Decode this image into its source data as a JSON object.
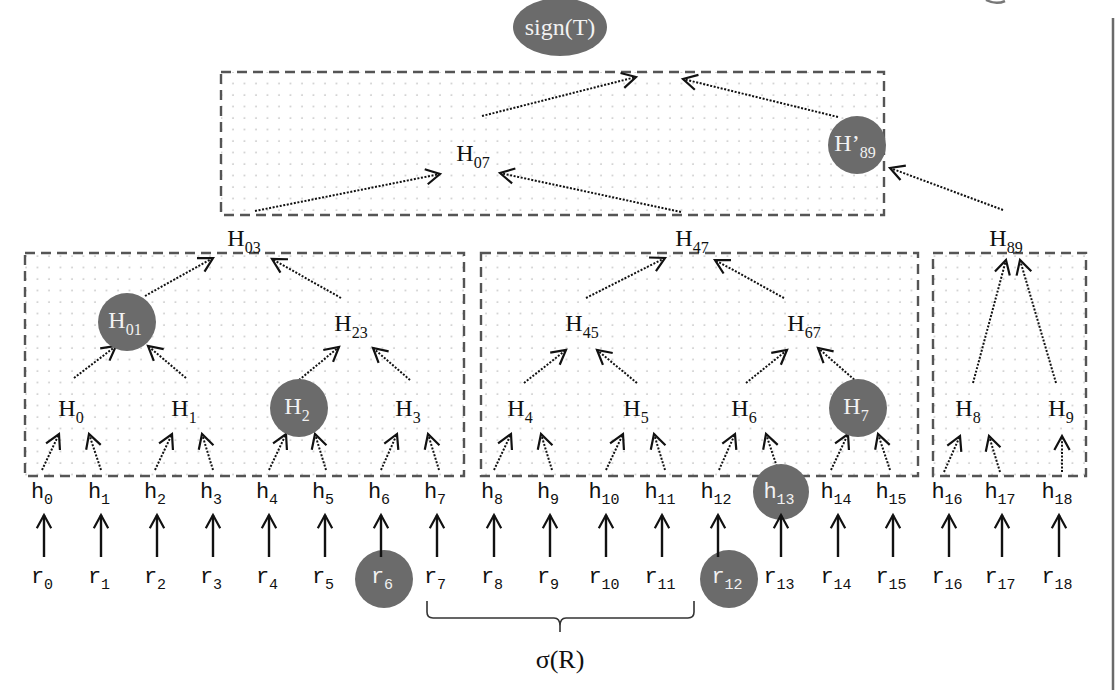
{
  "diagram": {
    "colors": {
      "highlight_fill": "#6b6b6b",
      "highlight_text": "#f2f2f2",
      "text": "#111111",
      "box_border": "#555555",
      "dot": "#c8c8c8",
      "arrow": "#111111"
    },
    "root": {
      "id": "signT",
      "label": "sign(T)",
      "x": 560,
      "y": 27,
      "highlight": true,
      "shape": "ellipse"
    },
    "boxes": [
      {
        "id": "box-top",
        "x": 221,
        "y": 72,
        "w": 663,
        "h": 143
      },
      {
        "id": "box-left",
        "x": 25,
        "y": 253,
        "w": 439,
        "h": 223
      },
      {
        "id": "box-mid",
        "x": 481,
        "y": 253,
        "w": 437,
        "h": 223
      },
      {
        "id": "box-right",
        "x": 933,
        "y": 253,
        "w": 153,
        "h": 223
      }
    ],
    "nodes": [
      {
        "id": "H07",
        "base": "H",
        "sub": "07",
        "x": 475,
        "y": 155,
        "highlight": false
      },
      {
        "id": "H89p",
        "base": "H’",
        "sub": "89",
        "x": 857,
        "y": 145,
        "highlight": true
      },
      {
        "id": "H03",
        "base": "H",
        "sub": "03",
        "x": 246,
        "y": 240,
        "highlight": false
      },
      {
        "id": "H47",
        "base": "H",
        "sub": "47",
        "x": 694,
        "y": 240,
        "highlight": false
      },
      {
        "id": "H89",
        "base": "H",
        "sub": "89",
        "x": 1008,
        "y": 240,
        "highlight": false
      },
      {
        "id": "H01",
        "base": "H",
        "sub": "01",
        "x": 127,
        "y": 322,
        "highlight": true
      },
      {
        "id": "H23",
        "base": "H",
        "sub": "23",
        "x": 353,
        "y": 325,
        "highlight": false
      },
      {
        "id": "H45",
        "base": "H",
        "sub": "45",
        "x": 584,
        "y": 325,
        "highlight": false
      },
      {
        "id": "H67",
        "base": "H",
        "sub": "67",
        "x": 806,
        "y": 325,
        "highlight": false
      },
      {
        "id": "H0",
        "base": "H",
        "sub": "0",
        "x": 73,
        "y": 410,
        "highlight": false
      },
      {
        "id": "H1",
        "base": "H",
        "sub": "1",
        "x": 186,
        "y": 410,
        "highlight": false
      },
      {
        "id": "H2",
        "base": "H",
        "sub": "2",
        "x": 299,
        "y": 408,
        "highlight": true
      },
      {
        "id": "H3",
        "base": "H",
        "sub": "3",
        "x": 410,
        "y": 410,
        "highlight": false
      },
      {
        "id": "H4",
        "base": "H",
        "sub": "4",
        "x": 522,
        "y": 410,
        "highlight": false
      },
      {
        "id": "H5",
        "base": "H",
        "sub": "5",
        "x": 638,
        "y": 410,
        "highlight": false
      },
      {
        "id": "H6",
        "base": "H",
        "sub": "6",
        "x": 746,
        "y": 410,
        "highlight": false
      },
      {
        "id": "H7",
        "base": "H",
        "sub": "7",
        "x": 858,
        "y": 408,
        "highlight": true
      },
      {
        "id": "H8",
        "base": "H",
        "sub": "8",
        "x": 970,
        "y": 410,
        "highlight": false
      },
      {
        "id": "H9",
        "base": "H",
        "sub": "9",
        "x": 1063,
        "y": 410,
        "highlight": false
      }
    ],
    "tree_edges": [
      {
        "from": [
          451,
          156
        ],
        "to": [
          440,
          174
        ],
        "x1": 425,
        "y1": 198,
        "x2": 441,
        "y2": 173,
        "comment": ""
      }
    ],
    "dotted_arrows": [
      {
        "x1": 482,
        "y1": 116,
        "x2": 636,
        "y2": 77
      },
      {
        "x1": 838,
        "y1": 117,
        "x2": 683,
        "y2": 79
      },
      {
        "x1": 255,
        "y1": 211,
        "x2": 440,
        "y2": 174
      },
      {
        "x1": 681,
        "y1": 212,
        "x2": 500,
        "y2": 173
      },
      {
        "x1": 1003,
        "y1": 210,
        "x2": 890,
        "y2": 168
      },
      {
        "x1": 145,
        "y1": 296,
        "x2": 213,
        "y2": 258
      },
      {
        "x1": 341,
        "y1": 298,
        "x2": 272,
        "y2": 259
      },
      {
        "x1": 586,
        "y1": 298,
        "x2": 665,
        "y2": 258
      },
      {
        "x1": 784,
        "y1": 298,
        "x2": 715,
        "y2": 260
      },
      {
        "x1": 973,
        "y1": 383,
        "x2": 1006,
        "y2": 260
      },
      {
        "x1": 1056,
        "y1": 383,
        "x2": 1020,
        "y2": 260
      },
      {
        "x1": 74,
        "y1": 378,
        "x2": 116,
        "y2": 346
      },
      {
        "x1": 186,
        "y1": 378,
        "x2": 148,
        "y2": 346
      },
      {
        "x1": 299,
        "y1": 380,
        "x2": 339,
        "y2": 347
      },
      {
        "x1": 410,
        "y1": 380,
        "x2": 373,
        "y2": 348
      },
      {
        "x1": 524,
        "y1": 383,
        "x2": 566,
        "y2": 350
      },
      {
        "x1": 637,
        "y1": 383,
        "x2": 597,
        "y2": 350
      },
      {
        "x1": 746,
        "y1": 383,
        "x2": 787,
        "y2": 350
      },
      {
        "x1": 857,
        "y1": 382,
        "x2": 818,
        "y2": 348
      },
      {
        "x1": 42,
        "y1": 470,
        "x2": 59,
        "y2": 434
      },
      {
        "x1": 101,
        "y1": 470,
        "x2": 89,
        "y2": 434
      },
      {
        "x1": 155,
        "y1": 470,
        "x2": 172,
        "y2": 434
      },
      {
        "x1": 213,
        "y1": 470,
        "x2": 202,
        "y2": 434
      },
      {
        "x1": 269,
        "y1": 470,
        "x2": 286,
        "y2": 434
      },
      {
        "x1": 326,
        "y1": 470,
        "x2": 315,
        "y2": 434
      },
      {
        "x1": 381,
        "y1": 470,
        "x2": 397,
        "y2": 434
      },
      {
        "x1": 439,
        "y1": 470,
        "x2": 428,
        "y2": 434
      },
      {
        "x1": 494,
        "y1": 470,
        "x2": 511,
        "y2": 434
      },
      {
        "x1": 552,
        "y1": 470,
        "x2": 541,
        "y2": 434
      },
      {
        "x1": 606,
        "y1": 470,
        "x2": 623,
        "y2": 434
      },
      {
        "x1": 665,
        "y1": 470,
        "x2": 654,
        "y2": 434
      },
      {
        "x1": 719,
        "y1": 470,
        "x2": 735,
        "y2": 434
      },
      {
        "x1": 778,
        "y1": 470,
        "x2": 766,
        "y2": 434
      },
      {
        "x1": 831,
        "y1": 470,
        "x2": 848,
        "y2": 434
      },
      {
        "x1": 890,
        "y1": 470,
        "x2": 878,
        "y2": 434
      },
      {
        "x1": 944,
        "y1": 472,
        "x2": 960,
        "y2": 436
      },
      {
        "x1": 1000,
        "y1": 472,
        "x2": 989,
        "y2": 436
      },
      {
        "x1": 1062,
        "y1": 472,
        "x2": 1062,
        "y2": 436
      }
    ],
    "leaves_h": [
      {
        "base": "h",
        "sub": "0",
        "x": 44,
        "highlight": false
      },
      {
        "base": "h",
        "sub": "1",
        "x": 101,
        "highlight": false
      },
      {
        "base": "h",
        "sub": "2",
        "x": 157,
        "highlight": false
      },
      {
        "base": "h",
        "sub": "3",
        "x": 213,
        "highlight": false
      },
      {
        "base": "h",
        "sub": "4",
        "x": 269,
        "highlight": false
      },
      {
        "base": "h",
        "sub": "5",
        "x": 325,
        "highlight": false
      },
      {
        "base": "h",
        "sub": "6",
        "x": 381,
        "highlight": false
      },
      {
        "base": "h",
        "sub": "7",
        "x": 437,
        "highlight": false
      },
      {
        "base": "h",
        "sub": "8",
        "x": 494,
        "highlight": false
      },
      {
        "base": "h",
        "sub": "9",
        "x": 550,
        "highlight": false
      },
      {
        "base": "h",
        "sub": "10",
        "x": 606,
        "highlight": false
      },
      {
        "base": "h",
        "sub": "11",
        "x": 662,
        "highlight": false
      },
      {
        "base": "h",
        "sub": "12",
        "x": 718,
        "highlight": false
      },
      {
        "base": "h",
        "sub": "13",
        "x": 781,
        "highlight": true
      },
      {
        "base": "h",
        "sub": "14",
        "x": 838,
        "highlight": false
      },
      {
        "base": "h",
        "sub": "15",
        "x": 893,
        "highlight": false
      },
      {
        "base": "h",
        "sub": "16",
        "x": 949,
        "highlight": false
      },
      {
        "base": "h",
        "sub": "17",
        "x": 1002,
        "highlight": false
      },
      {
        "base": "h",
        "sub": "18",
        "x": 1059,
        "highlight": false
      }
    ],
    "leaves_r": [
      {
        "base": "r",
        "sub": "0",
        "x": 44,
        "highlight": false
      },
      {
        "base": "r",
        "sub": "1",
        "x": 101,
        "highlight": false
      },
      {
        "base": "r",
        "sub": "2",
        "x": 157,
        "highlight": false
      },
      {
        "base": "r",
        "sub": "3",
        "x": 213,
        "highlight": false
      },
      {
        "base": "r",
        "sub": "4",
        "x": 269,
        "highlight": false
      },
      {
        "base": "r",
        "sub": "5",
        "x": 325,
        "highlight": false
      },
      {
        "base": "r",
        "sub": "6",
        "x": 384,
        "highlight": true
      },
      {
        "base": "r",
        "sub": "7",
        "x": 437,
        "highlight": false
      },
      {
        "base": "r",
        "sub": "8",
        "x": 494,
        "highlight": false
      },
      {
        "base": "r",
        "sub": "9",
        "x": 550,
        "highlight": false
      },
      {
        "base": "r",
        "sub": "10",
        "x": 606,
        "highlight": false
      },
      {
        "base": "r",
        "sub": "11",
        "x": 662,
        "highlight": false
      },
      {
        "base": "r",
        "sub": "12",
        "x": 729,
        "highlight": true
      },
      {
        "base": "r",
        "sub": "13",
        "x": 781,
        "highlight": false
      },
      {
        "base": "r",
        "sub": "14",
        "x": 838,
        "highlight": false
      },
      {
        "base": "r",
        "sub": "15",
        "x": 893,
        "highlight": false
      },
      {
        "base": "r",
        "sub": "16",
        "x": 949,
        "highlight": false
      },
      {
        "base": "r",
        "sub": "17",
        "x": 1002,
        "highlight": false
      },
      {
        "base": "r",
        "sub": "18",
        "x": 1059,
        "highlight": false
      }
    ],
    "brace": {
      "x1": 427,
      "x2": 694,
      "y": 618,
      "label": "σ(R)",
      "label_x": 560,
      "label_y": 668
    },
    "right_rule": {
      "x": 1113,
      "y1": 18,
      "y2": 690
    }
  }
}
